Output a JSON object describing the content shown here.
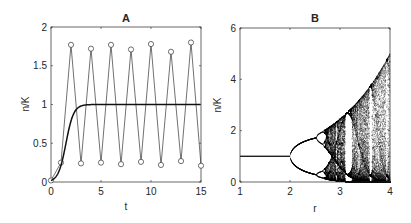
{
  "chart_data": [
    {
      "type": "line",
      "title": "A",
      "xlabel": "t",
      "ylabel": "n/K",
      "xlim": [
        0,
        15
      ],
      "ylim": [
        0,
        2
      ],
      "xticks": [
        "0",
        "5",
        "10",
        "15"
      ],
      "yticks": [
        "0",
        "0.5",
        "1",
        "1.5",
        "2"
      ],
      "grid": false,
      "series": [
        {
          "name": "discrete (markers)",
          "marker": "circle",
          "x": [
            0,
            1,
            2,
            3,
            4,
            5,
            6,
            7,
            8,
            9,
            10,
            11,
            12,
            13,
            14,
            15
          ],
          "values": [
            0.02,
            0.25,
            1.77,
            0.24,
            1.72,
            0.25,
            1.77,
            0.23,
            1.71,
            0.26,
            1.78,
            0.22,
            1.68,
            0.27,
            1.8,
            0.21
          ]
        },
        {
          "name": "continuous",
          "x": [
            0,
            0.5,
            1,
            1.5,
            2,
            2.5,
            3,
            3.5,
            4,
            5,
            10,
            15
          ],
          "values": [
            0.02,
            0.08,
            0.25,
            0.55,
            0.82,
            0.95,
            0.99,
            1.0,
            1.0,
            1.0,
            1.0,
            1.0
          ]
        }
      ]
    },
    {
      "type": "scatter",
      "title": "B",
      "xlabel": "r",
      "ylabel": "n/K",
      "xlim": [
        1,
        4
      ],
      "ylim": [
        0,
        6
      ],
      "xticks": [
        "1",
        "2",
        "3",
        "4"
      ],
      "yticks": [
        "0",
        "2",
        "4",
        "6"
      ],
      "grid": false,
      "description": "Bifurcation diagram: stable equilibrium n/K=1 for r<2, period-doubling cascade from r=2, chaos beyond ~2.7, upper envelope reaching ~5 at r=4",
      "series": [
        {
          "name": "attractor points",
          "r_range": [
            1,
            4
          ]
        }
      ]
    }
  ]
}
